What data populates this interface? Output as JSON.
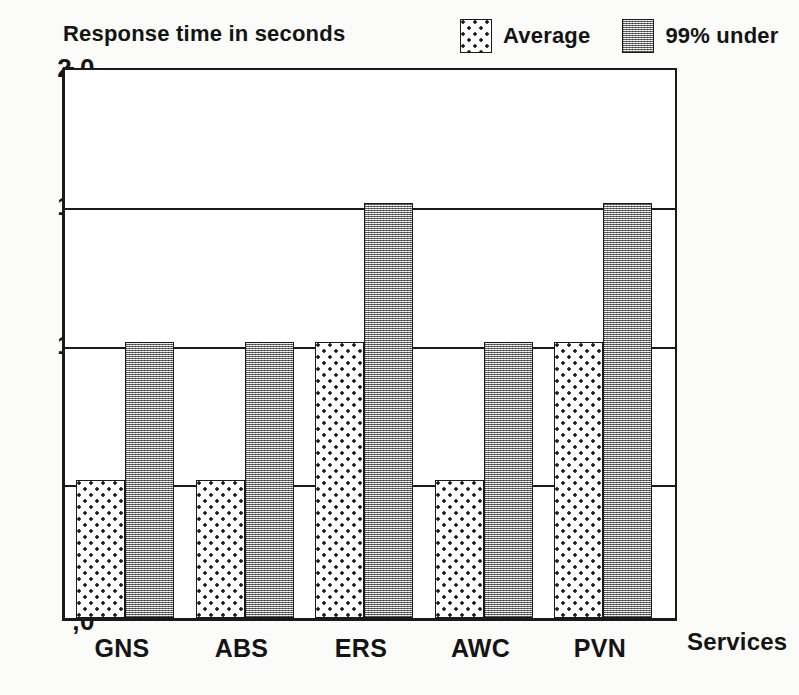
{
  "chart_data": {
    "type": "bar",
    "title": "",
    "ylabel": "Response time in seconds",
    "xlabel": "Services",
    "categories": [
      "GNS",
      "ABS",
      "ERS",
      "AWC",
      "PVN"
    ],
    "series": [
      {
        "name": "Average",
        "values": [
          0.5,
          0.5,
          1.0,
          0.5,
          1.0
        ],
        "pattern": "sparse-dots",
        "fill_color": "#ffffff",
        "dot_color": "#1b1b1b"
      },
      {
        "name": "99% under",
        "values": [
          1.0,
          1.0,
          1.5,
          1.0,
          1.5
        ],
        "pattern": "dense-stipple",
        "fill_color": "#b9b9b9",
        "dot_color": "#1e1e1e"
      }
    ],
    "ylim": [
      0.0,
      2.0
    ],
    "ytick_values": [
      2.0,
      1.5,
      1.0,
      0.5,
      0.0
    ],
    "ytick_labels": [
      "2,0",
      "1,5",
      "1,0",
      ",5",
      ",0"
    ],
    "grid": "horizontal",
    "legend_position": "top-right",
    "axis_color": "#1a1a1a",
    "background_color": "#fbfbf9",
    "decimal_separator": ","
  },
  "legend": {
    "entries": [
      {
        "label": "Average"
      },
      {
        "label": "99% under"
      }
    ]
  },
  "axes": {
    "y_title": "Response time in seconds",
    "x_title": "Services"
  }
}
